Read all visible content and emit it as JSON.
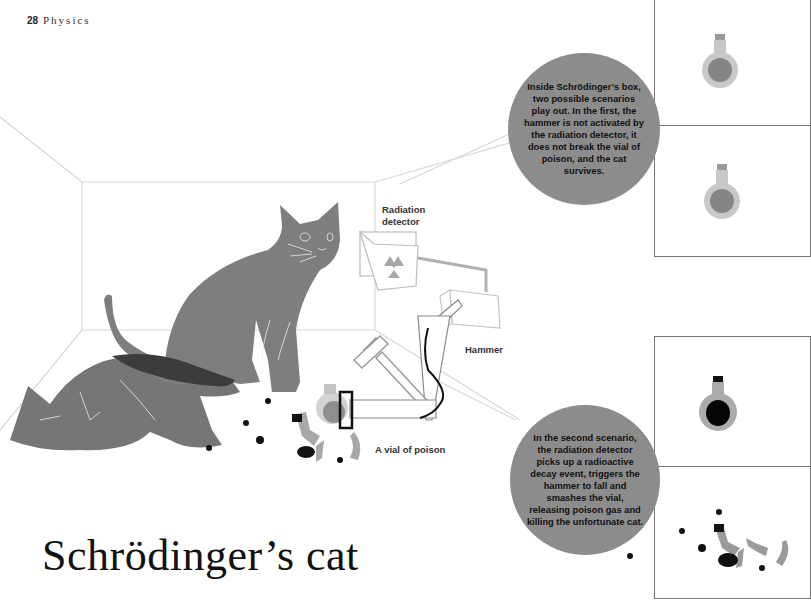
{
  "header": {
    "page_number": "28",
    "section": "Physics"
  },
  "title": "Schrödinger’s cat",
  "labels": {
    "radiation_detector_line1": "Radiation",
    "radiation_detector_line2": "detector",
    "hammer": "Hammer",
    "vial": "A vial of poison"
  },
  "scenario_1": {
    "text": "Inside Schrödinger’s box, two possible scenarios play out. In the first, the hammer is not activated by the radiation detector, it does not break the vial of poison, and the cat survives."
  },
  "scenario_2": {
    "text": "In the second scenario, the radiation detector picks up a radioactive decay event, triggers the hammer to fall and smashes the vial, releasing poison gas and killing the unfortunate cat."
  },
  "icons": {
    "radiation": "radiation-trefoil-icon",
    "vial": "poison-vial-icon",
    "hammer": "hammer-icon",
    "cat_alive": "sitting-cat",
    "cat_dead": "lying-cat"
  },
  "colors": {
    "cat": "#7a7a7a",
    "bubble": "#8c8c8c",
    "room_lines": "#d6d6d6",
    "poison": "#111111",
    "glass": "#c8c8c8"
  }
}
